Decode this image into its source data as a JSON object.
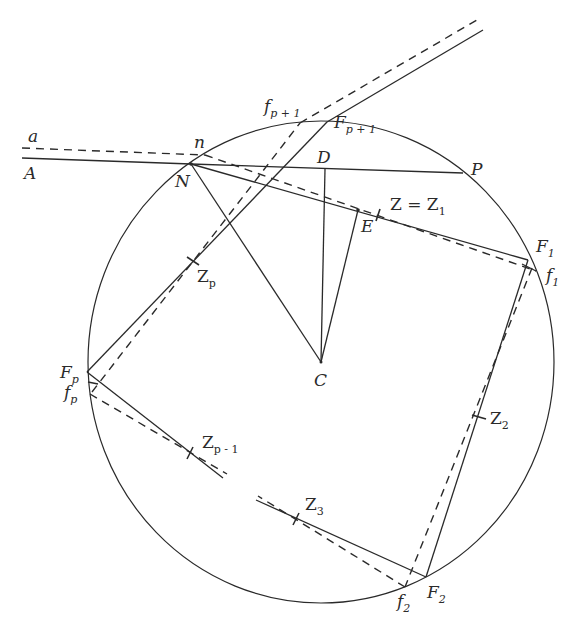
{
  "figure": {
    "type": "geometric-construction",
    "labels": {
      "a": "a",
      "A": "A",
      "n": "n",
      "N": "N",
      "D": "D",
      "P": "P",
      "E": "E",
      "C": "C",
      "Z_eq_Z1": "Z = Z",
      "Z_eq_Z1_sub": "1",
      "F1": "F",
      "F1_sub": "1",
      "f1": "f",
      "f1_sub": "1",
      "F2": "F",
      "F2_sub": "2",
      "f2": "f",
      "f2_sub": "2",
      "Z2": "Z",
      "Z2_sub": "2",
      "Z3": "Z",
      "Z3_sub": "3",
      "Fp": "F",
      "Fp_sub": "p",
      "fp": "f",
      "fp_sub": "p",
      "Zp": "Z",
      "Zp_sub": "p",
      "Zp1": "Z",
      "Zp1_sub": "p - 1",
      "Fpp1": "F",
      "Fpp1_sub": "p + 1",
      "fpp1": "f",
      "fpp1_sub": "p + 1"
    },
    "points": {
      "C": [
        321,
        362
      ],
      "N": [
        191,
        164
      ],
      "n": [
        205,
        155
      ],
      "D": [
        325,
        169
      ],
      "P": [
        463,
        173
      ],
      "E": [
        358,
        210
      ],
      "F1": [
        528,
        260
      ],
      "f1": [
        536,
        271
      ],
      "F2": [
        426,
        577
      ],
      "f2": [
        405,
        587
      ],
      "Fp": [
        87,
        372
      ],
      "fp": [
        90,
        394
      ],
      "Fp+1": [
        327,
        122
      ],
      "fp+1": [
        300,
        123
      ],
      "Z1": [
        378,
        215
      ],
      "Z2": [
        479,
        417
      ],
      "Z3": [
        296,
        519
      ],
      "Zp": [
        193,
        261
      ],
      "Zp-1": [
        190,
        453
      ]
    },
    "circle": {
      "cx": 321,
      "cy": 362,
      "r": 240
    }
  }
}
